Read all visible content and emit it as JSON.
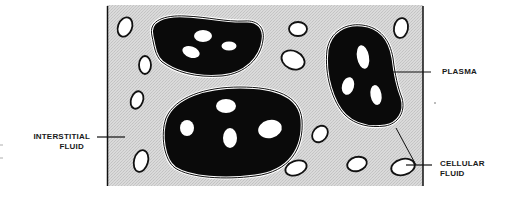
{
  "diagram": {
    "colors": {
      "interstitial_fill": "#d6d6d6",
      "cell_fill": "#0a0a0a",
      "plasma_fill": "#ffffff",
      "stroke": "#111111"
    },
    "labels": {
      "interstitial_line1": "INTERSTITIAL",
      "interstitial_line2": "FLUID",
      "plasma": "PLASMA",
      "cellular_line1": "CELLULAR",
      "cellular_line2": "FLUID"
    }
  }
}
